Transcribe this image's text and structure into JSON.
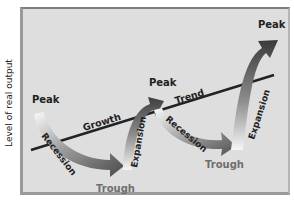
{
  "axis": {
    "ylabel": "Level of real output"
  },
  "labels": {
    "peak1": "Peak",
    "peak2": "Peak",
    "peak3": "Peak",
    "trough1": "Trough",
    "trough2": "Trough",
    "recession1": "Recession",
    "recession2": "Recession",
    "expansion1": "Expansion",
    "expansion2": "Expansion",
    "growth": "Growth",
    "trend": "Trend"
  },
  "colors": {
    "panel_bg": "#dedede",
    "trend_line": "#222222",
    "arrow_dark": "#555555",
    "arrow_light": "#f4f4f4",
    "trough_text": "#6e6e6e",
    "label_text": "#222222"
  }
}
